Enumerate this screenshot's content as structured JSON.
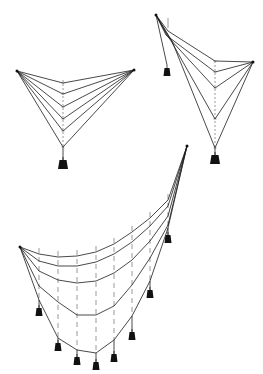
{
  "figure": {
    "colors": {
      "ink": "#1a1a1a",
      "background": "#ffffff"
    },
    "diagrams": [
      {
        "name": "symmetric-two-anchor",
        "anchors": [
          [
            17,
            71
          ],
          [
            134,
            70
          ]
        ],
        "vertical_x": 63,
        "vertex_y": [
          83,
          94,
          107,
          119,
          131,
          147
        ],
        "weight": {
          "x": 63,
          "y": 160,
          "size": "large"
        }
      },
      {
        "name": "asymmetric-two-anchor",
        "anchors": [
          [
            156,
            15
          ],
          [
            253,
            62
          ]
        ],
        "vertical_x": 215,
        "vertex_y": [
          61,
          72,
          88,
          119,
          148
        ],
        "small_weight": {
          "x": 167,
          "y": 68
        },
        "weight": {
          "x": 215,
          "y": 155,
          "size": "large"
        }
      },
      {
        "name": "multi-weight-catenary",
        "anchors": [
          [
            20,
            247
          ],
          [
            187,
            146
          ]
        ],
        "x": [
          20,
          39,
          58,
          77,
          96,
          114,
          132,
          150,
          168,
          187
        ],
        "curves": [
          [
            247,
            254,
            257,
            256,
            252,
            244,
            232,
            218,
            200,
            146
          ],
          [
            247,
            261,
            266,
            266,
            262,
            254,
            242,
            226,
            206,
            146
          ],
          [
            247,
            271,
            280,
            283,
            281,
            273,
            260,
            241,
            216,
            146
          ],
          [
            247,
            286,
            302,
            315,
            315,
            306,
            285,
            258,
            225,
            146
          ],
          [
            247,
            300,
            338,
            350,
            353,
            340,
            316,
            281,
            228,
            146
          ]
        ],
        "weights": [
          [
            39,
            308
          ],
          [
            58,
            343
          ],
          [
            77,
            357
          ],
          [
            96,
            362
          ],
          [
            114,
            354
          ],
          [
            132,
            332
          ],
          [
            150,
            290
          ],
          [
            168,
            235
          ]
        ]
      }
    ]
  }
}
